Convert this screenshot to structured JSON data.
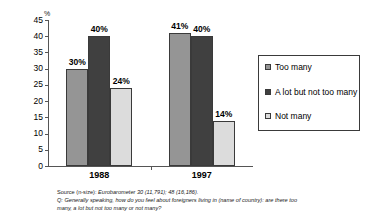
{
  "chart_data": {
    "type": "bar",
    "title": "",
    "xlabel": "",
    "ylabel": "%",
    "ylim": [
      0,
      45
    ],
    "yticks": [
      0,
      5,
      10,
      15,
      20,
      25,
      30,
      35,
      40,
      45
    ],
    "ytick_labels": [
      "0",
      "5",
      "10",
      "15",
      "20",
      "25",
      "30",
      "35",
      "40",
      "45"
    ],
    "grid": false,
    "legend_position": "right",
    "categories": [
      "1988",
      "1997"
    ],
    "series": [
      {
        "name": "Too many",
        "values": [
          30,
          41
        ],
        "labels": [
          "30%",
          "41%"
        ],
        "color": "#959595"
      },
      {
        "name": "A lot but not too many",
        "values": [
          40,
          40
        ],
        "labels": [
          "40%",
          "40%"
        ],
        "color": "#404040"
      },
      {
        "name": "Not many",
        "values": [
          24,
          14
        ],
        "labels": [
          "24%",
          "14%"
        ],
        "color": "#dcdcdc"
      }
    ]
  },
  "axis": {
    "unit_label": "%"
  },
  "legend": {
    "items": [
      {
        "label": "Too many"
      },
      {
        "label": "A lot but not too many"
      },
      {
        "label": "Not many"
      }
    ]
  },
  "footnotes": {
    "source_prefix": "Source (n-size): ",
    "source_value": "Eurobarometer 30 (11,791); 48 (16,186).",
    "question_line1": "Q: Generally speaking, how do you feel about foreigners living in (name of country): are there too",
    "question_line2": "many, a lot but not too many or not many?"
  }
}
